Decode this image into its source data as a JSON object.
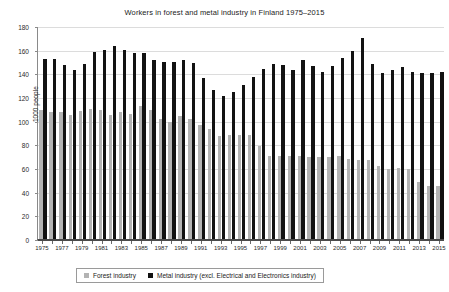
{
  "chart_data": {
    "type": "bar",
    "title": "Workers in forest and metal industry in Finland 1975–2015",
    "xlabel": "",
    "ylabel": "1000 people",
    "ylim": [
      0,
      180
    ],
    "ytick_step": 20,
    "yticks": [
      0,
      20,
      40,
      60,
      80,
      100,
      120,
      140,
      160,
      180
    ],
    "grid": true,
    "legend_position": "bottom",
    "categories": [
      "1975",
      "1976",
      "1977",
      "1978",
      "1979",
      "1980",
      "1981",
      "1982",
      "1983",
      "1984",
      "1985",
      "1986",
      "1987",
      "1988",
      "1989",
      "1990",
      "1991",
      "1992",
      "1993",
      "1994",
      "1995",
      "1996",
      "1997",
      "1998",
      "1999",
      "2000",
      "2001",
      "2002",
      "2003",
      "2004",
      "2005",
      "2006",
      "2007",
      "2008",
      "2009",
      "2010",
      "2011",
      "2012",
      "2013",
      "2014",
      "2015"
    ],
    "xtick_labels": [
      "1975",
      "1977",
      "1979",
      "1981",
      "1983",
      "1985",
      "1987",
      "1989",
      "1991",
      "1993",
      "1995",
      "1997",
      "1999",
      "2001",
      "2003",
      "2005",
      "2007",
      "2009",
      "2011",
      "2013",
      "2015"
    ],
    "series": [
      {
        "name": "Forest industry",
        "color": "#b3b3b3",
        "values": [
          109,
          107,
          107,
          105,
          108,
          110,
          109,
          105,
          107,
          106,
          112,
          109,
          101,
          99,
          104,
          101,
          96,
          93,
          87,
          88,
          88,
          88,
          79,
          70,
          70,
          70,
          70,
          69,
          69,
          69,
          70,
          68,
          67,
          67,
          62,
          59,
          60,
          59,
          48,
          45,
          45
        ]
      },
      {
        "name": "Metal industry (excl. Electrical and Electronics industry)",
        "color": "#121212",
        "values": [
          152,
          152,
          147,
          143,
          148,
          158,
          160,
          163,
          160,
          157,
          157,
          151,
          150,
          150,
          151,
          149,
          136,
          126,
          121,
          124,
          130,
          137,
          144,
          148,
          147,
          143,
          151,
          146,
          141,
          146,
          153,
          159,
          170,
          148,
          140,
          143,
          145,
          141,
          140,
          140,
          141
        ]
      }
    ]
  }
}
